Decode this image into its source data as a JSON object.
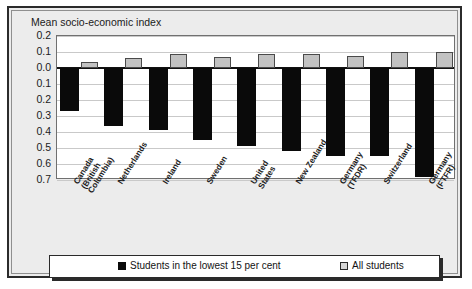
{
  "chart_data": {
    "type": "bar",
    "title": "Mean socio-economic index",
    "xlabel": "",
    "ylabel": "Mean socio-economic index",
    "ylim": [
      -0.7,
      0.2
    ],
    "yticks": [
      "0.2",
      "0.1",
      "0.0",
      "0.1",
      "0.2",
      "0.3",
      "0.4",
      "0.5",
      "0.6",
      "0.7"
    ],
    "ytick_values": [
      0.2,
      0.1,
      0.0,
      -0.1,
      -0.2,
      -0.3,
      -0.4,
      -0.5,
      -0.6,
      -0.7
    ],
    "grid": true,
    "legend_position": "bottom",
    "categories": [
      "Canada\n(British\nColumbia)",
      "Netherlands",
      "Ireland",
      "Sweden",
      "United\nStates",
      "New Zealand",
      "Germany\n(TFDR)",
      "Switzerland",
      "Germany\n(FTFR)"
    ],
    "series": [
      {
        "name": "Students in the lowest 15 per cent",
        "color": "#0a0a0a",
        "values": [
          -0.27,
          -0.36,
          -0.39,
          -0.45,
          -0.49,
          -0.52,
          -0.55,
          -0.55,
          -0.68
        ]
      },
      {
        "name": "All students",
        "color": "#c2c2c2",
        "values": [
          0.035,
          0.065,
          0.085,
          0.07,
          0.085,
          0.085,
          0.075,
          0.1,
          0.1
        ]
      }
    ]
  },
  "legend": {
    "items": [
      {
        "label": "Students in the lowest 15 per cent",
        "swatch": "black-square-icon"
      },
      {
        "label": "All students",
        "swatch": "grey-square-icon"
      }
    ]
  }
}
